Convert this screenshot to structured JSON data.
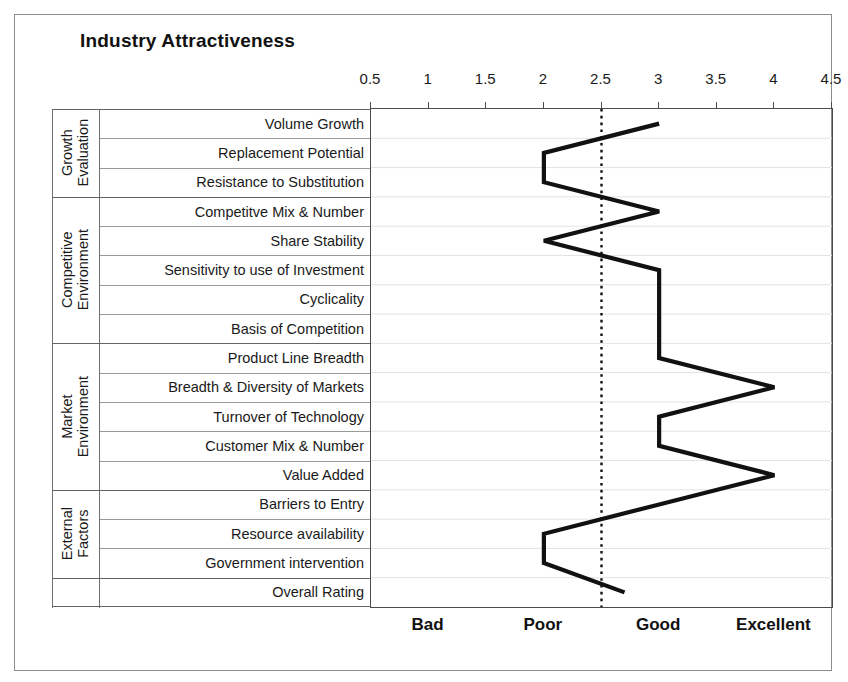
{
  "chart_title": "Industry Attractiveness",
  "axis": {
    "top_ticks": [
      "0.5",
      "1",
      "1.5",
      "2",
      "2.5",
      "3",
      "3.5",
      "4",
      "4.5"
    ],
    "bottom_labels": [
      "Bad",
      "Poor",
      "Good",
      "Excellent"
    ],
    "bottom_label_positions": [
      1,
      2,
      3,
      4
    ],
    "reference_line_value": "2.5"
  },
  "groups": [
    {
      "name": "Growth Evaluation",
      "line1": "Growth",
      "line2": "Evaluation",
      "row_count": 3
    },
    {
      "name": "Competitive Environment",
      "line1": "Competitive",
      "line2": "Environment",
      "row_count": 5
    },
    {
      "name": "Market Environment",
      "line1": "Market",
      "line2": "Environment",
      "row_count": 5
    },
    {
      "name": "External Factors",
      "line1": "External",
      "line2": "Factors",
      "row_count": 3
    },
    {
      "name": "",
      "line1": "",
      "line2": "",
      "row_count": 1
    }
  ],
  "rows": [
    {
      "label": "Volume Growth",
      "value": 3.0
    },
    {
      "label": "Replacement Potential",
      "value": 2.0
    },
    {
      "label": "Resistance to Substitution",
      "value": 2.0
    },
    {
      "label": "Competitve Mix & Number",
      "value": 3.0
    },
    {
      "label": "Share Stability",
      "value": 2.0
    },
    {
      "label": "Sensitivity to use of Investment",
      "value": 3.0
    },
    {
      "label": "Cyclicality",
      "value": 3.0
    },
    {
      "label": "Basis of Competition",
      "value": 3.0
    },
    {
      "label": "Product Line Breadth",
      "value": 3.0
    },
    {
      "label": "Breadth & Diversity of Markets",
      "value": 4.0
    },
    {
      "label": "Turnover of Technology",
      "value": 3.0
    },
    {
      "label": "Customer Mix & Number",
      "value": 3.0
    },
    {
      "label": "Value Added",
      "value": 4.0
    },
    {
      "label": "Barriers to Entry",
      "value": 3.0
    },
    {
      "label": "Resource availability",
      "value": 2.0
    },
    {
      "label": "Government intervention",
      "value": 2.0
    },
    {
      "label": "Overall Rating",
      "value": 2.7
    }
  ],
  "colors": {
    "line": "#111111",
    "frame": "#8d8d8d",
    "grid": "#9a9a9a",
    "axis": "#4c4c4c",
    "reference": "#111111"
  },
  "chart_data": {
    "type": "line",
    "title": "Industry Attractiveness",
    "orientation": "horizontal",
    "xlabel": "",
    "ylabel": "",
    "xlim": [
      0.5,
      4.5
    ],
    "grid": true,
    "legend": "none",
    "reference_line": 2.5,
    "x_ticks": [
      0.5,
      1,
      1.5,
      2,
      2.5,
      3,
      3.5,
      4,
      4.5
    ],
    "x_tick_labels": [
      "0.5",
      "1",
      "1.5",
      "2",
      "2.5",
      "3",
      "3.5",
      "4",
      "4.5"
    ],
    "qualitative_scale": [
      {
        "label": "Bad",
        "value": 1
      },
      {
        "label": "Poor",
        "value": 2
      },
      {
        "label": "Good",
        "value": 3
      },
      {
        "label": "Excellent",
        "value": 4
      }
    ],
    "categories": [
      "Volume Growth",
      "Replacement Potential",
      "Resistance to Substitution",
      "Competitve Mix & Number",
      "Share Stability",
      "Sensitivity to use of Investment",
      "Cyclicality",
      "Basis of Competition",
      "Product Line Breadth",
      "Breadth & Diversity of Markets",
      "Turnover of Technology",
      "Customer Mix & Number",
      "Value Added",
      "Barriers to Entry",
      "Resource availability",
      "Government intervention",
      "Overall Rating"
    ],
    "values": [
      3,
      2,
      2,
      3,
      2,
      3,
      3,
      3,
      3,
      4,
      3,
      3,
      4,
      3,
      2,
      2,
      2.7
    ],
    "groups": [
      {
        "name": "Growth Evaluation",
        "categories": [
          "Volume Growth",
          "Replacement Potential",
          "Resistance to Substitution"
        ]
      },
      {
        "name": "Competitive Environment",
        "categories": [
          "Competitve Mix & Number",
          "Share Stability",
          "Sensitivity to use of Investment",
          "Cyclicality",
          "Basis of Competition"
        ]
      },
      {
        "name": "Market Environment",
        "categories": [
          "Product Line Breadth",
          "Breadth & Diversity of Markets",
          "Turnover of Technology",
          "Customer Mix & Number",
          "Value Added"
        ]
      },
      {
        "name": "External Factors",
        "categories": [
          "Barriers to Entry",
          "Resource availability",
          "Government intervention"
        ]
      },
      {
        "name": "",
        "categories": [
          "Overall Rating"
        ]
      }
    ]
  }
}
